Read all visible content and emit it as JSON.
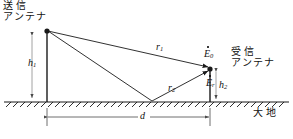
{
  "figure": {
    "line_color": "#1a1a1a",
    "ground_color": "#1a1a1a",
    "dimension_color": "#555555"
  },
  "labels": {
    "tx_antenna_line1": "送信",
    "tx_antenna_line2": "アンテナ",
    "rx_antenna_line1": "受信",
    "rx_antenna_line2": "アンテナ",
    "earth": "大地",
    "h1": "h",
    "h1_sub": "1",
    "h2": "h",
    "h2_sub": "2",
    "distance": "d",
    "r1": "r",
    "r1_sub": "1",
    "r2": "r",
    "r2_sub": "2",
    "e0": "E",
    "e0_sub": "0",
    "er": "E",
    "er_sub": "r"
  },
  "geometry": {
    "ground_y": 102,
    "tx_x": 47,
    "tx_top_y": 30,
    "rx_x": 210,
    "rx_top_y": 68,
    "reflection_x": 152,
    "dimension_y": 117,
    "tx_height_px": 72,
    "rx_height_px": 34,
    "separation_px": 163
  }
}
